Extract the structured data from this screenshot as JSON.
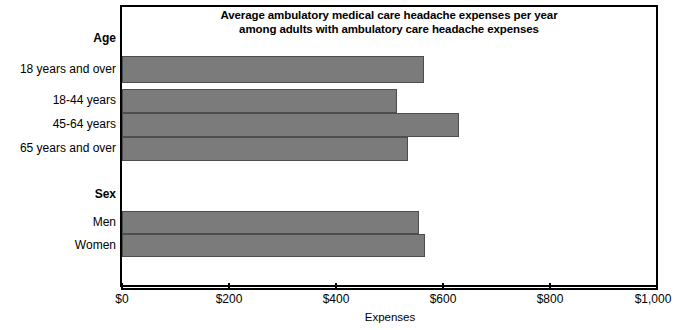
{
  "chart_data": {
    "type": "bar",
    "orientation": "horizontal",
    "title": "Average ambulatory medical care headache expenses per year among adults with ambulatory care headache expenses",
    "title_lines": [
      "Average ambulatory medical care headache expenses per year",
      "among adults with ambulatory care headache expenses"
    ],
    "xlabel": "Expenses",
    "ylabel": "",
    "xlim": [
      0,
      1000
    ],
    "grid": false,
    "legend": null,
    "bar_color": "#7b7b7b",
    "bar_edge_color": "#4d4d4d",
    "xticks": [
      0,
      200,
      400,
      600,
      800,
      1000
    ],
    "xtick_labels": [
      "$0",
      "$200",
      "$400",
      "$600",
      "$800",
      "$1,000"
    ],
    "groups": [
      {
        "label": "Age",
        "categories": [
          "18 years and over",
          "18-44 years",
          "45-64 years",
          "65 years and over"
        ],
        "values": [
          564,
          514,
          630,
          535
        ]
      },
      {
        "label": "Sex",
        "categories": [
          "Men",
          "Women"
        ],
        "values": [
          555,
          566
        ]
      }
    ],
    "categories": [
      "18 years and over",
      "18-44 years",
      "45-64 years",
      "65 years and over",
      "Men",
      "Women"
    ],
    "values": [
      564,
      514,
      630,
      535,
      555,
      566
    ]
  },
  "labels": {
    "group_age": "Age",
    "cat_18_over": "18 years and over",
    "cat_18_44": "18-44 years",
    "cat_45_64": "45-64 years",
    "cat_65_over": "65 years and over",
    "group_sex": "Sex",
    "cat_men": "Men",
    "cat_women": "Women"
  },
  "axis": {
    "tick_0": "$0",
    "tick_200": "$200",
    "tick_400": "$400",
    "tick_600": "$600",
    "tick_800": "$800",
    "tick_1000": "$1,000",
    "title": "Expenses"
  },
  "title": {
    "line1": "Average ambulatory medical care headache expenses per year",
    "line2": "among adults with ambulatory care headache expenses"
  }
}
